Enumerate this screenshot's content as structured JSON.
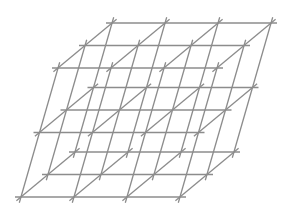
{
  "diagram": {
    "type": "3d-cubic-lattice-wireframe",
    "projection": "oblique",
    "background": "#ffffff",
    "line_color": "#8c8c8c",
    "line_width": 1.3,
    "grid_counts": {
      "x_units": 3,
      "depth_units": 2,
      "vertical_units": 2
    },
    "origin": [
      21,
      197
    ],
    "x_unit": [
      53,
      0
    ],
    "depth_unit": [
      27,
      -22.5
    ],
    "vertical_unit": [
      18.5,
      -64.5
    ],
    "overhang": 6
  }
}
